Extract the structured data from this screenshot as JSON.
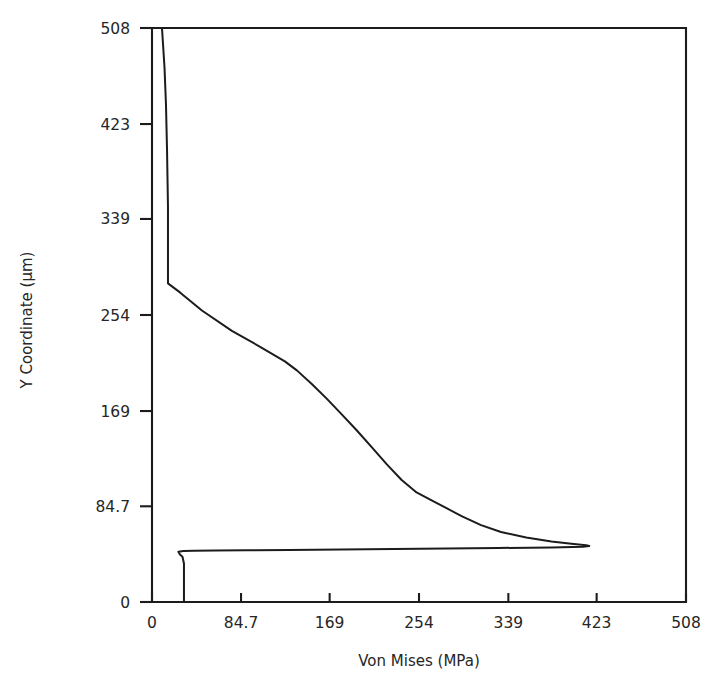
{
  "chart_data": {
    "type": "line",
    "title": "",
    "subtitle": "",
    "xlabel": "Von Mises (MPa)",
    "ylabel": "Y Coordinate (μm)",
    "xlim": [
      0,
      508
    ],
    "ylim": [
      0,
      508
    ],
    "xticks": [
      0,
      84.7,
      169,
      254,
      339,
      423,
      508
    ],
    "yticks": [
      0,
      84.7,
      169,
      254,
      339,
      423,
      508
    ],
    "xtick_labels": [
      "0",
      "84.7",
      "169",
      "254",
      "339",
      "423",
      "508"
    ],
    "ytick_labels": [
      "0",
      "84.7",
      "169",
      "254",
      "339",
      "423",
      "508"
    ],
    "grid": false,
    "legend": null,
    "legend_position": "none",
    "annotations": [],
    "series": [
      {
        "name": "Von Mises stress profile",
        "orientation": "x-value-vs-y-coordinate",
        "points": [
          [
            9.5,
            508.0
          ],
          [
            11.9,
            473.0
          ],
          [
            13.3,
            440.0
          ],
          [
            14.3,
            400.0
          ],
          [
            15.2,
            350.0
          ],
          [
            15.2,
            290.0
          ],
          [
            15.2,
            282.0
          ],
          [
            26.6,
            274.0
          ],
          [
            47.5,
            258.0
          ],
          [
            76.0,
            240.0
          ],
          [
            104.5,
            225.0
          ],
          [
            126.4,
            213.0
          ],
          [
            137.8,
            205.0
          ],
          [
            152.0,
            193.0
          ],
          [
            166.2,
            180.0
          ],
          [
            180.5,
            166.0
          ],
          [
            194.7,
            152.0
          ],
          [
            209.0,
            137.0
          ],
          [
            223.2,
            122.0
          ],
          [
            237.5,
            108.0
          ],
          [
            251.7,
            97.0
          ],
          [
            266.0,
            90.0
          ],
          [
            280.2,
            83.0
          ],
          [
            294.5,
            76.0
          ],
          [
            313.0,
            68.0
          ],
          [
            332.0,
            62.0
          ],
          [
            356.0,
            57.0
          ],
          [
            380.0,
            53.5
          ],
          [
            399.0,
            51.5
          ],
          [
            413.0,
            50.2
          ],
          [
            416.0,
            49.5
          ],
          [
            410.0,
            48.8
          ],
          [
            380.0,
            48.3
          ],
          [
            330.0,
            47.8
          ],
          [
            280.0,
            47.3
          ],
          [
            230.0,
            46.9
          ],
          [
            180.0,
            46.5
          ],
          [
            130.0,
            46.1
          ],
          [
            90.0,
            45.8
          ],
          [
            60.0,
            45.6
          ],
          [
            40.0,
            45.4
          ],
          [
            30.0,
            45.2
          ],
          [
            25.1,
            44.5
          ],
          [
            26.6,
            42.0
          ],
          [
            29.0,
            40.0
          ],
          [
            30.4,
            34.0
          ],
          [
            30.4,
            20.0
          ],
          [
            30.4,
            6.0
          ],
          [
            30.4,
            0.0
          ]
        ]
      }
    ]
  },
  "figure": {
    "x_axis_title": "Von Mises (MPa)",
    "y_axis_title": "Y Coordinate (μm)"
  }
}
